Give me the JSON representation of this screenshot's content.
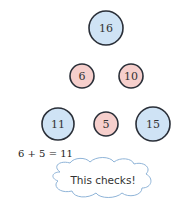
{
  "colors": {
    "blue_fill": "#cfe3f5",
    "pink_fill": "#f6cfcc",
    "stroke": "#2a2f38",
    "cloud_stroke": "#8fb4d8"
  },
  "nodes": [
    {
      "id": "top",
      "label": "16",
      "cx": 106,
      "cy": 28,
      "r": 17,
      "kind": "blue"
    },
    {
      "id": "mid-left",
      "label": "6",
      "cx": 82,
      "cy": 76,
      "r": 12,
      "kind": "pink"
    },
    {
      "id": "mid-right",
      "label": "10",
      "cx": 131,
      "cy": 76,
      "r": 12,
      "kind": "pink"
    },
    {
      "id": "bottom-left",
      "label": "11",
      "cx": 58,
      "cy": 124,
      "r": 16,
      "kind": "blue"
    },
    {
      "id": "bottom-center",
      "label": "5",
      "cx": 106,
      "cy": 124,
      "r": 12,
      "kind": "pink"
    },
    {
      "id": "bottom-right",
      "label": "15",
      "cx": 153,
      "cy": 124,
      "r": 17,
      "kind": "blue"
    }
  ],
  "equation": "6 + 5 = 11",
  "callout": "This checks!"
}
